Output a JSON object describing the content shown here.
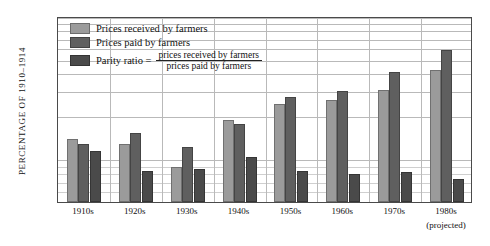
{
  "chart_data": {
    "type": "bar",
    "title": "",
    "subtitle": "",
    "xlabel": "",
    "ylabel": "PERCENTAGE OF 1910–1914",
    "scale": "log",
    "ylim": [
      50,
      1000
    ],
    "yticks": [
      50,
      60,
      70,
      80,
      90,
      100,
      200,
      300,
      400,
      500,
      600,
      700,
      800,
      900,
      1000
    ],
    "ytick_labels": [
      "50",
      "60",
      "70",
      "80",
      "90",
      "100",
      "200",
      "300",
      "400",
      "500",
      "600",
      "700",
      "800",
      "900",
      "1,000"
    ],
    "grid": true,
    "legend_position": "upper-left",
    "categories": [
      "1910s",
      "1920s",
      "1930s",
      "1940s",
      "1950s",
      "1960s",
      "1970s",
      "1980s"
    ],
    "category_sublabels": [
      "",
      "",
      "",
      "",
      "",
      "",
      "",
      "(projected)"
    ],
    "series": [
      {
        "name": "Prices received by farmers",
        "color": "#9b9b9b",
        "values": [
          138,
          127,
          88,
          188,
          243,
          257,
          303,
          420
        ]
      },
      {
        "name": "Prices paid by farmers",
        "color": "#5f5f5f",
        "values": [
          127,
          152,
          122,
          175,
          272,
          300,
          408,
          575
        ]
      },
      {
        "name": "Parity ratio",
        "color": "#4a4a4a",
        "values": [
          113,
          82,
          85,
          103,
          83,
          79,
          81,
          72
        ]
      }
    ]
  },
  "legend": {
    "items": [
      {
        "label": "Prices received by farmers",
        "swatch": "#9b9b9b"
      },
      {
        "label": "Prices paid by farmers",
        "swatch": "#5f5f5f"
      },
      {
        "label": "Parity ratio",
        "swatch": "#4a4a4a"
      }
    ],
    "parity_equals": "Parity ratio  =",
    "parity_numerator": "prices received by farmers",
    "parity_denominator": "prices paid by farmers"
  }
}
